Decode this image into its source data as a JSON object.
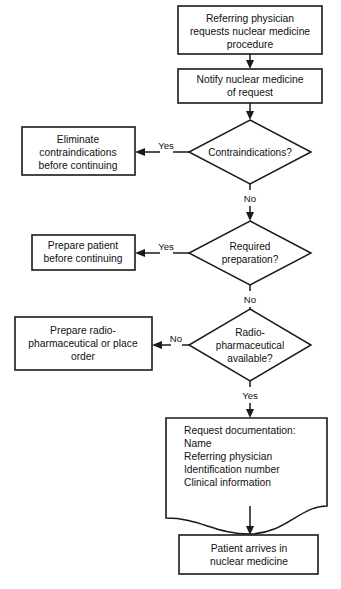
{
  "diagram": {
    "colors": {
      "background": "#ffffff",
      "stroke": "#1a1a1a",
      "text": "#111111"
    },
    "nodes": {
      "start": {
        "shape": "process",
        "lines": [
          "Referring physician",
          "requests nuclear medicine",
          "procedure"
        ]
      },
      "notify": {
        "shape": "process",
        "lines": [
          "Notify nuclear medicine",
          "of request"
        ]
      },
      "decision_contraindications": {
        "shape": "decision",
        "lines": [
          "Contraindications?"
        ]
      },
      "eliminate": {
        "shape": "process",
        "lines": [
          "Eliminate",
          "contraindications",
          "before continuing"
        ]
      },
      "decision_preparation": {
        "shape": "decision",
        "lines": [
          "Required",
          "preparation?"
        ]
      },
      "prepare_patient": {
        "shape": "process",
        "lines": [
          "Prepare patient",
          "before continuing"
        ]
      },
      "decision_radiopharmaceutical": {
        "shape": "decision",
        "lines": [
          "Radio-",
          "pharmaceutical",
          "available?"
        ]
      },
      "prepare_radiopharmaceutical": {
        "shape": "process",
        "lines": [
          "Prepare radio-",
          "pharmaceutical or place",
          "order"
        ]
      },
      "documentation": {
        "shape": "document",
        "lines": [
          "Request documentation:",
          "Name",
          "Referring physician",
          "Identification number",
          "Clinical information"
        ]
      },
      "arrival": {
        "shape": "process",
        "lines": [
          "Patient arrives in",
          "nuclear medicine"
        ]
      }
    },
    "edge_labels": {
      "contraindications_yes": "Yes",
      "contraindications_no": "No",
      "preparation_yes": "Yes",
      "preparation_no": "No",
      "radiopharmaceutical_no": "No",
      "radiopharmaceutical_yes": "Yes"
    }
  }
}
